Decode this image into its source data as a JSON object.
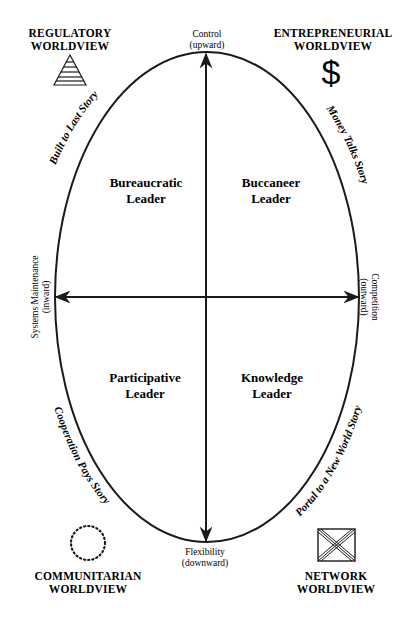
{
  "diagram": {
    "worldviews": {
      "regulatory": {
        "line1": "REGULATORY",
        "line2": "WORLDVIEW",
        "icon": "pyramid-icon"
      },
      "entrepreneurial": {
        "line1": "ENTREPRENEURIAL",
        "line2": "WORLDVIEW",
        "icon": "dollar-icon",
        "symbol": "$"
      },
      "communitarian": {
        "line1": "COMMUNITARIAN",
        "line2": "WORLDVIEW",
        "icon": "dotted-circle-icon"
      },
      "network": {
        "line1": "NETWORK",
        "line2": "WORLDVIEW",
        "icon": "network-box-icon"
      }
    },
    "axes": {
      "top": {
        "line1": "Control",
        "line2": "(upward)"
      },
      "bottom": {
        "line1": "Flexibility",
        "line2": "(downward)"
      },
      "left": {
        "line1": "Systems Maintenance",
        "line2": "(inward)"
      },
      "right": {
        "line1": "Competition",
        "line2": "(outward)"
      }
    },
    "quadrants": {
      "top_left": {
        "line1": "Bureaucratic",
        "line2": "Leader"
      },
      "top_right": {
        "line1": "Buccaneer",
        "line2": "Leader"
      },
      "bottom_left": {
        "line1": "Participative",
        "line2": "Leader"
      },
      "bottom_right": {
        "line1": "Knowledge",
        "line2": "Leader"
      }
    },
    "stories": {
      "top_left": "Built to Last Story",
      "top_right": "Money Talks Story",
      "bottom_left": "Cooperation Pays Story",
      "bottom_right": "Portal to a New World Story"
    }
  }
}
